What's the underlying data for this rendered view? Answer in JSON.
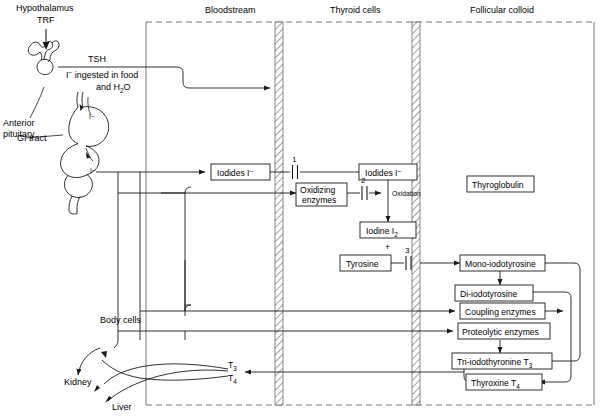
{
  "figure": {
    "columns": [
      {
        "id": "bloodstream",
        "label": "Bloodstream"
      },
      {
        "id": "thyroid_cells",
        "label": "Thyroid cells"
      },
      {
        "id": "follicular_colloid",
        "label": "Follicular colloid"
      }
    ],
    "anatomy_labels": [
      {
        "id": "hypothalamus",
        "label": "Hypothalamus"
      },
      {
        "id": "trf",
        "label": "TRF"
      },
      {
        "id": "anterior_pituitary_line1",
        "label": "Anterior"
      },
      {
        "id": "anterior_pituitary_line2",
        "label": "pituitary"
      },
      {
        "id": "tsh",
        "label": "TSH"
      },
      {
        "id": "gi_tract",
        "label": "GI tract"
      },
      {
        "id": "body_cells",
        "label": "Body cells"
      },
      {
        "id": "kidney",
        "label": "Kidney"
      },
      {
        "id": "liver",
        "label": "Liver"
      }
    ],
    "ingestion_note": {
      "line1_prefix": "I",
      "line1_sup": "−",
      "line1_rest": " ingested in food",
      "line2_prefix": "and H",
      "line2_sub": "2",
      "line2_rest": "O"
    },
    "iodide_marks": [
      {
        "id": "stomach-iodide",
        "label": "I−"
      },
      {
        "id": "intestine-iodide",
        "label": "I−"
      }
    ],
    "boxes": [
      {
        "id": "iodides-blood",
        "label": "Iodides I⁻",
        "column": "bloodstream"
      },
      {
        "id": "oxidizing",
        "label_line1": "Oxidizing",
        "label_line2": "enzymes",
        "column": "thyroid_cells"
      },
      {
        "id": "iodides-cell",
        "label": "Iodides I⁻",
        "column": "thyroid_cells"
      },
      {
        "id": "iodine",
        "label_prefix": "Iodine I",
        "label_sub": "2",
        "column": "thyroid_cells"
      },
      {
        "id": "tyrosine",
        "label": "Tyrosine",
        "column": "thyroid_cells"
      },
      {
        "id": "thyroglobulin",
        "label": "Thyroglobulin",
        "column": "follicular_colloid"
      },
      {
        "id": "mono",
        "label": "Mono-iodotyrosine",
        "column": "follicular_colloid"
      },
      {
        "id": "di",
        "label": "Di-iodotyrosine",
        "column": "follicular_colloid"
      },
      {
        "id": "coupling",
        "label": "Coupling enzymes",
        "column": "follicular_colloid"
      },
      {
        "id": "proteolytic",
        "label": "Proteolytic enzymes",
        "column": "follicular_colloid"
      },
      {
        "id": "t3box",
        "label_prefix": "Tri-iodothyronine T",
        "label_sub": "3",
        "column": "follicular_colloid"
      },
      {
        "id": "t4box",
        "label_prefix": "Thyroxine T",
        "label_sub": "4",
        "column": "follicular_colloid"
      }
    ],
    "process_labels": [
      {
        "id": "oxidation",
        "label": "Oxidation"
      },
      {
        "id": "plus-sign",
        "label": "+"
      }
    ],
    "step_numbers": [
      {
        "id": "step-1",
        "label": "1"
      },
      {
        "id": "step-2",
        "label": "2"
      },
      {
        "id": "step-3",
        "label": "3"
      }
    ],
    "hormone_outputs": [
      {
        "id": "t3-out",
        "prefix": "T",
        "sub": "3"
      },
      {
        "id": "t4-out",
        "prefix": "T",
        "sub": "4"
      }
    ],
    "colors": {
      "stroke": "#1a1a1a",
      "boxfill": "#ffffff",
      "hatch": "#555555",
      "dashed": "#666666"
    }
  }
}
